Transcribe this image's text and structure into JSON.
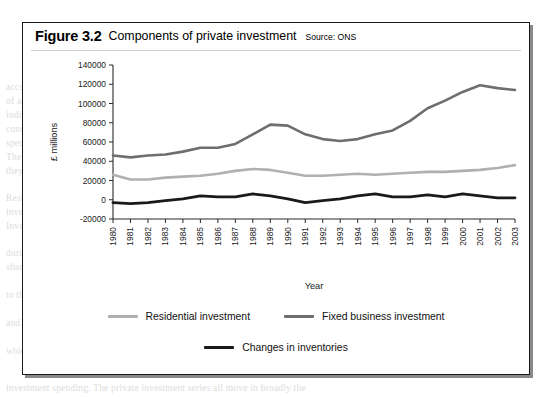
{
  "figure": {
    "number": "Figure 3.2",
    "title": "Components of private investment",
    "source": "Source: ONS"
  },
  "legend": {
    "items": [
      {
        "label": "Residential investment",
        "color": "#b0b0b0"
      },
      {
        "label": "Fixed business investment",
        "color": "#6e6e6e"
      },
      {
        "label": "Changes in inventories",
        "color": "#1a1a1a"
      }
    ]
  },
  "chart_data": {
    "type": "line",
    "title": "Components of private investment",
    "xlabel": "Year",
    "ylabel": "£ millions",
    "ylim": [
      -20000,
      140000
    ],
    "ytick_step": 20000,
    "yticks": [
      -20000,
      0,
      20000,
      40000,
      60000,
      80000,
      100000,
      120000,
      140000
    ],
    "grid": false,
    "legend_position": "bottom",
    "categories": [
      "1980",
      "1981",
      "1982",
      "1983",
      "1984",
      "1985",
      "1986",
      "1987",
      "1988",
      "1989",
      "1990",
      "1991",
      "1992",
      "1993",
      "1994",
      "1995",
      "1996",
      "1997",
      "1998",
      "1999",
      "2000",
      "2001",
      "2002",
      "2003"
    ],
    "series": [
      {
        "name": "Residential investment",
        "color": "#b0b0b0",
        "values": [
          26000,
          21000,
          21000,
          23000,
          24000,
          25000,
          27000,
          30000,
          32000,
          31000,
          28000,
          25000,
          25000,
          26000,
          27000,
          26000,
          27000,
          28000,
          29000,
          29000,
          30000,
          31000,
          33000,
          36000
        ]
      },
      {
        "name": "Fixed business investment",
        "color": "#6e6e6e",
        "values": [
          46000,
          44000,
          46000,
          47000,
          50000,
          54000,
          54000,
          58000,
          68000,
          78000,
          77000,
          68000,
          63000,
          61000,
          63000,
          68000,
          72000,
          82000,
          95000,
          103000,
          112000,
          119000,
          116000,
          114000
        ]
      },
      {
        "name": "Changes in inventories",
        "color": "#1a1a1a",
        "values": [
          -3000,
          -4000,
          -3000,
          -1000,
          1000,
          4000,
          3000,
          3000,
          6000,
          4000,
          1000,
          -3000,
          -1000,
          1000,
          4000,
          6000,
          3000,
          3000,
          5000,
          3000,
          6000,
          4000,
          2000,
          2000
        ]
      }
    ]
  },
  "page_bleed": {
    "lines": [
      {
        "x": 6,
        "y": 82,
        "text": "account. Overall economic performance, however, requires another measure"
      },
      {
        "x": 6,
        "y": 96,
        "text": "of activity which is not simply the sum of what each of the components"
      },
      {
        "x": 6,
        "y": 110,
        "text": "indicate. There are changes in the level of inventories that must also be"
      },
      {
        "x": 6,
        "y": 124,
        "text": "considered, and these may move against the general pattern of investment"
      },
      {
        "x": 6,
        "y": 138,
        "text": "spending over the course of the business cycle as firms respond to demand."
      },
      {
        "x": 6,
        "y": 152,
        "text": "The figure opposite shows the relative size of each component and how"
      },
      {
        "x": 6,
        "y": 166,
        "text": "they have varied across more than two decades of recorded activity."
      },
      {
        "x": 6,
        "y": 193,
        "text": "Residential investment has grown only slowly while business fixed"
      },
      {
        "x": 6,
        "y": 207,
        "text": "investment has more than doubled over the same period of time."
      },
      {
        "x": 6,
        "y": 221,
        "text": "Inventories remain small by comparison but are highly volatile."
      },
      {
        "x": 6,
        "y": 248,
        "text": "during the recession of the early nineties, when stocks were run down"
      },
      {
        "x": 6,
        "y": 262,
        "text": "sharply as output fell away and firms attempted to limit their exposure"
      },
      {
        "x": 6,
        "y": 290,
        "text": "to the downturn that followed the long expansion of the later eighties"
      },
      {
        "x": 6,
        "y": 318,
        "text": "and the subsequent recovery in investment demand across the economy"
      },
      {
        "x": 6,
        "y": 346,
        "text": "which is reported in the national accounts on a quarterly basis."
      },
      {
        "x": 6,
        "y": 383,
        "text": "investment spending. The private investment series all move in broadly the"
      }
    ]
  }
}
